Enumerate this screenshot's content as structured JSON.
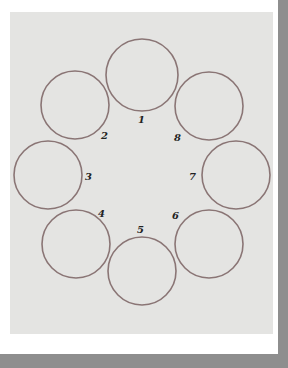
{
  "diagram": {
    "circle_color": "#8a7575",
    "panel_color": "#e4e4e2",
    "frame_color": "#8e8e8e",
    "circles": [
      {
        "label": "1",
        "cx": 142,
        "cy": 75,
        "r": 36,
        "lx": 138,
        "ly": 123
      },
      {
        "label": "2",
        "cx": 75,
        "cy": 105,
        "r": 34,
        "lx": 101,
        "ly": 139
      },
      {
        "label": "3",
        "cx": 48,
        "cy": 175,
        "r": 34,
        "lx": 85,
        "ly": 180
      },
      {
        "label": "4",
        "cx": 76,
        "cy": 244,
        "r": 34,
        "lx": 98,
        "ly": 217
      },
      {
        "label": "5",
        "cx": 142,
        "cy": 271,
        "r": 34,
        "lx": 137,
        "ly": 233
      },
      {
        "label": "6",
        "cx": 209,
        "cy": 244,
        "r": 34,
        "lx": 172,
        "ly": 219
      },
      {
        "label": "7",
        "cx": 236,
        "cy": 175,
        "r": 34,
        "lx": 189,
        "ly": 180
      },
      {
        "label": "8",
        "cx": 209,
        "cy": 106,
        "r": 34,
        "lx": 174,
        "ly": 141
      }
    ]
  }
}
